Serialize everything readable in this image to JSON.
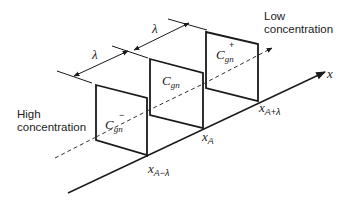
{
  "figure": {
    "type": "diffusion-planes-schematic",
    "region_labels": {
      "low": [
        "Low",
        "concentration"
      ],
      "high": [
        "High",
        "concentration"
      ]
    },
    "axis_label": "x",
    "spacing_symbol": "λ",
    "planes": [
      {
        "symbol": "C",
        "subscript": "gn",
        "superscript": "−",
        "position_label": {
          "base": "x",
          "sub": "A−λ"
        }
      },
      {
        "symbol": "C",
        "subscript": "gn",
        "superscript": "",
        "position_label": {
          "base": "x",
          "sub": "A"
        }
      },
      {
        "symbol": "C",
        "subscript": "gn",
        "superscript": "+",
        "position_label": {
          "base": "x",
          "sub": "A+λ"
        }
      }
    ],
    "colors": {
      "line": "#1a1a1a",
      "text": "#222222",
      "background": "#ffffff"
    }
  }
}
